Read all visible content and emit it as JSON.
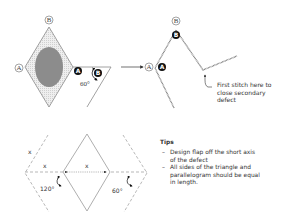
{
  "figure": {
    "panel_top_left": {
      "labels": {
        "point_a_open": "A",
        "point_b_open": "B",
        "point_a_filled": "A",
        "point_b_filled": "B",
        "angle": "60°"
      },
      "colors": {
        "defect_fill": "#8c8c8c",
        "diamond_fill": "#e6e6e6",
        "stroke": "#8a8a8a",
        "marker_fill": "#111111"
      }
    },
    "panel_top_right": {
      "labels": {
        "point_a_open": "A",
        "point_b_open": "B",
        "point_a_filled": "A",
        "point_b_filled": "B"
      },
      "annotation": [
        "First stitch here to",
        "close secondary",
        "defect"
      ]
    },
    "panel_bottom_left": {
      "labels": {
        "x_upper_left": "x",
        "x_middle_left": "x",
        "x_center": "x",
        "angle_left": "120°",
        "angle_right": "60°"
      }
    },
    "tips": {
      "title": "Tips",
      "items": [
        [
          "Design flap off the short axis",
          "of the defect"
        ],
        [
          "All sides of the triangle and",
          "parallelogram should be equal",
          "in length."
        ]
      ]
    }
  }
}
